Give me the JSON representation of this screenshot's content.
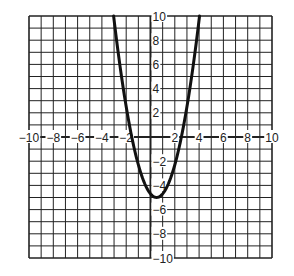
{
  "chart_data": {
    "type": "line",
    "title": "",
    "xlabel": "",
    "ylabel": "",
    "xlim": [
      -10,
      10
    ],
    "ylim": [
      -10,
      10
    ],
    "grid": true,
    "grid_step": 1,
    "x_tick_labels": [
      "-10",
      "-8",
      "-6",
      "-4",
      "-2",
      "2",
      "4",
      "6",
      "8",
      "10"
    ],
    "y_tick_labels": [
      "10",
      "8",
      "6",
      "4",
      "2",
      "-2",
      "-4",
      "-6",
      "-8",
      "-10"
    ],
    "x_ticks": [
      -10,
      -8,
      -6,
      -4,
      -2,
      2,
      4,
      6,
      8,
      10
    ],
    "y_ticks": [
      10,
      8,
      6,
      4,
      2,
      -2,
      -4,
      -6,
      -8,
      -10
    ],
    "series": [
      {
        "name": "parabola",
        "equation_estimate": "y = 1.2(x - 0.5)^2 - 5",
        "vertex": [
          0.5,
          -5
        ],
        "x_intercepts": [
          -1.5,
          2.5
        ],
        "x": [
          -3.05,
          -2.5,
          -2,
          -1.5,
          -1,
          -0.5,
          0,
          0.5,
          1,
          1.5,
          2,
          2.5,
          3,
          3.5,
          4.05
        ],
        "y": [
          10,
          4.6,
          2.5,
          -0.2,
          -2.3,
          -3.8,
          -4.7,
          -5,
          -4.7,
          -3.8,
          -2.3,
          -0.2,
          2.5,
          5.8,
          10
        ]
      }
    ]
  },
  "labels": {
    "x": [
      "−10",
      "−8",
      "−6",
      "−4",
      "−2",
      "2",
      "4",
      "6",
      "8",
      "10"
    ],
    "y": [
      "10",
      "8",
      "6",
      "4",
      "2",
      "−2",
      "−4",
      "−6",
      "−8",
      "−10"
    ]
  },
  "style": {
    "grid_color": "#222222",
    "curve_color": "#111111",
    "background": "#ffffff"
  }
}
